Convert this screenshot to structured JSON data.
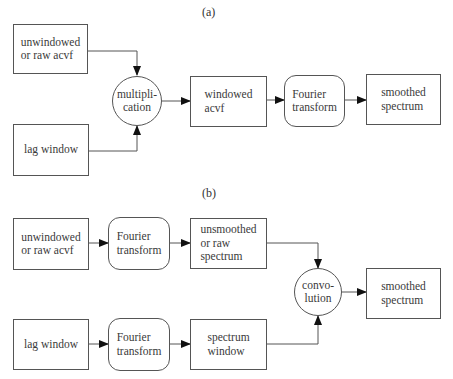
{
  "diagram": {
    "panel_a": {
      "label": "(a)",
      "nodes": {
        "raw_acvf": "unwindowed\nor raw acvf",
        "lag_window": "lag window",
        "multiplication": "multipli-\ncation",
        "windowed_acvf": "windowed\nacvf",
        "fourier_transform": "Fourier\ntransform",
        "smoothed_spectrum": "smoothed\nspectrum"
      },
      "edges": [
        [
          "raw_acvf",
          "multiplication"
        ],
        [
          "lag_window",
          "multiplication"
        ],
        [
          "multiplication",
          "windowed_acvf"
        ],
        [
          "windowed_acvf",
          "fourier_transform"
        ],
        [
          "fourier_transform",
          "smoothed_spectrum"
        ]
      ]
    },
    "panel_b": {
      "label": "(b)",
      "nodes": {
        "raw_acvf": "unwindowed\nor raw acvf",
        "fourier_transform_1": "Fourier\ntransform",
        "raw_spectrum": "unsmoothed\nor raw\nspectrum",
        "lag_window": "lag window",
        "fourier_transform_2": "Fourier\ntransform",
        "spectrum_window": "spectrum\nwindow",
        "convolution": "convo-\nlution",
        "smoothed_spectrum": "smoothed\nspectrum"
      },
      "edges": [
        [
          "raw_acvf",
          "fourier_transform_1"
        ],
        [
          "fourier_transform_1",
          "raw_spectrum"
        ],
        [
          "lag_window",
          "fourier_transform_2"
        ],
        [
          "fourier_transform_2",
          "spectrum_window"
        ],
        [
          "raw_spectrum",
          "convolution"
        ],
        [
          "spectrum_window",
          "convolution"
        ],
        [
          "convolution",
          "smoothed_spectrum"
        ]
      ]
    }
  }
}
